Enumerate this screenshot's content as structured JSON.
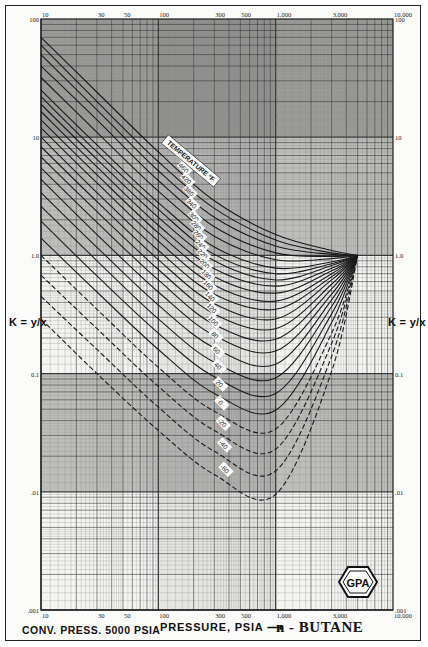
{
  "chart_data": {
    "type": "line",
    "subtitle": "CONV. PRESS. 5000 PSIA",
    "xlabel": "PRESSURE, PSIA",
    "ylabel": "K = y/x",
    "xscale": "log",
    "yscale": "log",
    "xlim": [
      10,
      10000
    ],
    "ylim": [
      0.001,
      100
    ],
    "grid": true,
    "legend_label": "TEMPERATURE, °F",
    "x_tick_labels_top": [
      "10",
      "30",
      "50",
      "100",
      "300",
      "500",
      "1,000",
      "3,000",
      "10,000"
    ],
    "x_tick_labels_bottom": [
      "10",
      "30",
      "50",
      "100",
      "300",
      "500",
      "1,000",
      "3,000",
      "10,000"
    ],
    "y_tick_labels": [
      "100",
      "10",
      "1.0",
      "0.1",
      ".01",
      ".001"
    ],
    "convergence_point": {
      "pressure": 5000,
      "K": 1.0
    },
    "series": [
      {
        "name": "500",
        "values": [
          [
            10,
            70
          ],
          [
            30,
            24
          ],
          [
            100,
            7.5
          ],
          [
            300,
            2.9
          ],
          [
            1000,
            1.5
          ],
          [
            3000,
            1.1
          ],
          [
            5000,
            1.0
          ]
        ]
      },
      {
        "name": "460",
        "values": [
          [
            10,
            60
          ],
          [
            30,
            20
          ],
          [
            100,
            6.2
          ],
          [
            300,
            2.5
          ],
          [
            1000,
            1.35
          ],
          [
            3000,
            1.05
          ],
          [
            5000,
            1.0
          ]
        ]
      },
      {
        "name": "420",
        "values": [
          [
            10,
            50
          ],
          [
            30,
            17
          ],
          [
            100,
            5.2
          ],
          [
            300,
            2.1
          ],
          [
            1000,
            1.2
          ],
          [
            3000,
            1.02
          ],
          [
            5000,
            1.0
          ]
        ]
      },
      {
        "name": "380",
        "values": [
          [
            10,
            40
          ],
          [
            30,
            14
          ],
          [
            100,
            4.3
          ],
          [
            300,
            1.75
          ],
          [
            1000,
            1.05
          ],
          [
            3000,
            0.98
          ],
          [
            5000,
            1.0
          ]
        ]
      },
      {
        "name": "340",
        "values": [
          [
            10,
            32
          ],
          [
            30,
            11
          ],
          [
            100,
            3.5
          ],
          [
            300,
            1.45
          ],
          [
            1000,
            0.92
          ],
          [
            3000,
            0.94
          ],
          [
            5000,
            1.0
          ]
        ]
      },
      {
        "name": "300",
        "values": [
          [
            10,
            25
          ],
          [
            30,
            8.6
          ],
          [
            100,
            2.8
          ],
          [
            300,
            1.18
          ],
          [
            1000,
            0.78
          ],
          [
            3000,
            0.88
          ],
          [
            5000,
            1.0
          ]
        ]
      },
      {
        "name": "280",
        "values": [
          [
            10,
            22
          ],
          [
            30,
            7.5
          ],
          [
            100,
            2.45
          ],
          [
            300,
            1.02
          ],
          [
            1000,
            0.7
          ],
          [
            3000,
            0.85
          ],
          [
            5000,
            1.0
          ]
        ]
      },
      {
        "name": "260",
        "values": [
          [
            10,
            19
          ],
          [
            30,
            6.5
          ],
          [
            100,
            2.1
          ],
          [
            300,
            0.9
          ],
          [
            1000,
            0.62
          ],
          [
            3000,
            0.82
          ],
          [
            5000,
            1.0
          ]
        ]
      },
      {
        "name": "240",
        "values": [
          [
            10,
            16.5
          ],
          [
            30,
            5.6
          ],
          [
            100,
            1.8
          ],
          [
            300,
            0.77
          ],
          [
            1000,
            0.55
          ],
          [
            3000,
            0.78
          ],
          [
            5000,
            1.0
          ]
        ]
      },
      {
        "name": "220",
        "values": [
          [
            10,
            14
          ],
          [
            30,
            4.8
          ],
          [
            100,
            1.55
          ],
          [
            300,
            0.66
          ],
          [
            1000,
            0.48
          ],
          [
            3000,
            0.74
          ],
          [
            5000,
            1.0
          ]
        ]
      },
      {
        "name": "200",
        "values": [
          [
            10,
            12
          ],
          [
            30,
            4.1
          ],
          [
            100,
            1.32
          ],
          [
            300,
            0.56
          ],
          [
            1000,
            0.41
          ],
          [
            3000,
            0.7
          ],
          [
            5000,
            1.0
          ]
        ]
      },
      {
        "name": "180",
        "values": [
          [
            10,
            10
          ],
          [
            30,
            3.4
          ],
          [
            100,
            1.1
          ],
          [
            300,
            0.47
          ],
          [
            1000,
            0.35
          ],
          [
            3000,
            0.66
          ],
          [
            5000,
            1.0
          ]
        ]
      },
      {
        "name": "160",
        "values": [
          [
            10,
            8.3
          ],
          [
            30,
            2.85
          ],
          [
            100,
            0.92
          ],
          [
            300,
            0.39
          ],
          [
            1000,
            0.29
          ],
          [
            3000,
            0.62
          ],
          [
            5000,
            1.0
          ]
        ]
      },
      {
        "name": "140",
        "values": [
          [
            10,
            6.8
          ],
          [
            30,
            2.35
          ],
          [
            100,
            0.76
          ],
          [
            300,
            0.32
          ],
          [
            1000,
            0.24
          ],
          [
            3000,
            0.57
          ],
          [
            5000,
            1.0
          ]
        ]
      },
      {
        "name": "120",
        "values": [
          [
            10,
            5.5
          ],
          [
            30,
            1.9
          ],
          [
            100,
            0.62
          ],
          [
            300,
            0.26
          ],
          [
            1000,
            0.195
          ],
          [
            3000,
            0.52
          ],
          [
            5000,
            1.0
          ]
        ]
      },
      {
        "name": "100",
        "values": [
          [
            10,
            4.4
          ],
          [
            30,
            1.5
          ],
          [
            100,
            0.49
          ],
          [
            300,
            0.21
          ],
          [
            1000,
            0.155
          ],
          [
            3000,
            0.47
          ],
          [
            5000,
            1.0
          ]
        ]
      },
      {
        "name": "80",
        "values": [
          [
            10,
            3.4
          ],
          [
            30,
            1.17
          ],
          [
            100,
            0.38
          ],
          [
            300,
            0.165
          ],
          [
            1000,
            0.12
          ],
          [
            3000,
            0.42
          ],
          [
            5000,
            1.0
          ]
        ]
      },
      {
        "name": "60",
        "values": [
          [
            10,
            2.6
          ],
          [
            30,
            0.9
          ],
          [
            100,
            0.29
          ],
          [
            300,
            0.125
          ],
          [
            1000,
            0.092
          ],
          [
            3000,
            0.37
          ],
          [
            5000,
            1.0
          ]
        ]
      },
      {
        "name": "40",
        "values": [
          [
            10,
            1.95
          ],
          [
            30,
            0.67
          ],
          [
            100,
            0.22
          ],
          [
            300,
            0.094
          ],
          [
            1000,
            0.068
          ],
          [
            3000,
            0.32
          ],
          [
            5000,
            1.0
          ]
        ]
      },
      {
        "name": "20",
        "values": [
          [
            10,
            1.4
          ],
          [
            30,
            0.49
          ],
          [
            100,
            0.16
          ],
          [
            300,
            0.068
          ],
          [
            1000,
            0.049
          ],
          [
            3000,
            0.27
          ],
          [
            5000,
            1.0
          ]
        ]
      },
      {
        "name": "0",
        "values": [
          [
            10,
            1.0
          ],
          [
            30,
            0.35
          ],
          [
            100,
            0.113
          ],
          [
            300,
            0.048
          ],
          [
            1000,
            0.034
          ],
          [
            3000,
            0.22
          ],
          [
            5000,
            1.0
          ]
        ],
        "style": "dashed"
      },
      {
        "name": "-20",
        "values": [
          [
            10,
            0.68
          ],
          [
            30,
            0.24
          ],
          [
            100,
            0.078
          ],
          [
            300,
            0.033
          ],
          [
            1000,
            0.023
          ],
          [
            3000,
            0.18
          ],
          [
            5000,
            1.0
          ]
        ],
        "style": "dashed"
      },
      {
        "name": "-40",
        "values": [
          [
            10,
            0.45
          ],
          [
            30,
            0.16
          ],
          [
            100,
            0.052
          ],
          [
            300,
            0.022
          ],
          [
            1000,
            0.015
          ],
          [
            3000,
            0.14
          ],
          [
            5000,
            1.0
          ]
        ],
        "style": "dashed"
      },
      {
        "name": "-60",
        "values": [
          [
            10,
            0.29
          ],
          [
            30,
            0.1
          ],
          [
            100,
            0.033
          ],
          [
            300,
            0.014
          ],
          [
            1000,
            0.0095
          ],
          [
            3000,
            0.105
          ],
          [
            5000,
            1.0
          ]
        ],
        "style": "dashed"
      }
    ]
  },
  "labels": {
    "k_left": "K = y/x",
    "k_right": "K = y/x",
    "conv_press": "CONV. PRESS. 5000 PSIA",
    "pressure_axis": "PRESSURE, PSIA ⟶",
    "component": "n - BUTANE",
    "temperature_legend": "TEMPERATURE °F",
    "logo_text": "GPA"
  },
  "colors": {
    "ink": "#1a1a1a",
    "grid_dark": "#3a3a3a",
    "grid_light": "#8a8a8a",
    "band_dark": "#4a4a4a",
    "paper": "#f4f4f2"
  }
}
